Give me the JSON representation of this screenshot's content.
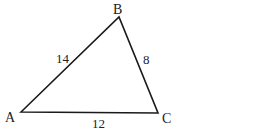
{
  "diagram": {
    "type": "triangle",
    "vertices": [
      {
        "name": "A",
        "label": "A",
        "x": 21,
        "y": 112
      },
      {
        "name": "B",
        "label": "B",
        "x": 119,
        "y": 17
      },
      {
        "name": "C",
        "label": "C",
        "x": 158,
        "y": 113
      }
    ],
    "sides": [
      {
        "from": "A",
        "to": "B",
        "length_label": "14"
      },
      {
        "from": "B",
        "to": "C",
        "length_label": "8"
      },
      {
        "from": "A",
        "to": "C",
        "length_label": "12"
      }
    ],
    "stroke_color": "#1a1a1a",
    "background": "#ffffff"
  }
}
